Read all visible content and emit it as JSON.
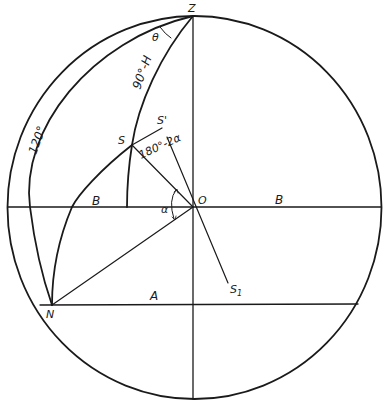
{
  "diagram": {
    "type": "celestial-sphere-construction",
    "points": {
      "zenith": "Z",
      "center": "O",
      "star": "S",
      "star_prime": "S'",
      "star_one": "S",
      "star_one_sub": "1",
      "north": "N"
    },
    "labels": {
      "theta": "θ",
      "colatitude": "90°-H",
      "supplement": "180°-2α",
      "alpha": "α",
      "arc_120": "120°",
      "segment_a": "A",
      "segment_b_left": "B",
      "segment_b_right": "B"
    },
    "colors": {
      "ink": "#1a1a1a",
      "background": "#ffffff"
    }
  }
}
